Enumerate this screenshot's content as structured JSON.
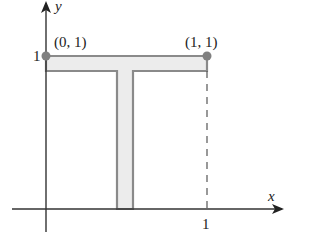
{
  "diagram": {
    "axes": {
      "x_label": "x",
      "y_label": "y",
      "x_tick": "1",
      "y_tick": "1"
    },
    "points": [
      {
        "label": "(0, 1)",
        "x": 0,
        "y": 1
      },
      {
        "label": "(1, 1)",
        "x": 1,
        "y": 1
      }
    ],
    "shape": {
      "description": "T-shaped region (thin lamina) with top bar along y=1 from x=0 to x=1 and a vertical stem down to the x-axis",
      "fill_color": "#ececec",
      "stroke_color": "#8a8a8a"
    },
    "colors": {
      "axis": "#333333",
      "point": "#808080",
      "dashed": "#555555"
    }
  }
}
